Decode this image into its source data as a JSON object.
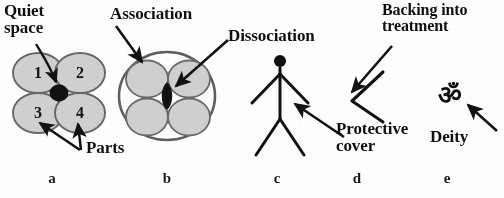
{
  "figure": {
    "title_alt": "Five-panel schematic of parts, association, dissociation, protective cover and deity",
    "background_color": "#fdfcfa",
    "ink_color": "#111111",
    "circle_fill": "#cfcfcf",
    "circle_stroke": "#6a6a6a"
  },
  "panels": [
    {
      "letter": "a",
      "name": "parts-and-quiet-space",
      "labels": {
        "quiet_space": "Quiet\nspace",
        "parts": "Parts"
      },
      "circles": [
        {
          "number": "1"
        },
        {
          "number": "2"
        },
        {
          "number": "3"
        },
        {
          "number": "4"
        }
      ]
    },
    {
      "letter": "b",
      "name": "association-dissociation",
      "labels": {
        "association": "Association",
        "dissociation": "Dissociation"
      }
    },
    {
      "letter": "c",
      "name": "stick-figure-person",
      "labels": {}
    },
    {
      "letter": "d",
      "name": "protective-cover-chevron",
      "labels": {
        "backing_into_treatment": "Backing into\ntreatment",
        "protective_cover": "Protective\ncover"
      }
    },
    {
      "letter": "e",
      "name": "deity-om-symbol",
      "labels": {
        "deity": "Deity",
        "om_symbol": "ॐ"
      }
    }
  ],
  "panel_letters": {
    "a": "a",
    "b": "b",
    "c": "c",
    "d": "d",
    "e": "e"
  }
}
